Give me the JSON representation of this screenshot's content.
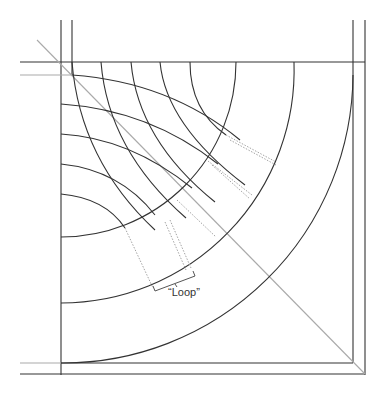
{
  "diagram": {
    "type": "quilting-curve-construction",
    "label_loop": "“Loop”",
    "colors": {
      "line": "#333333",
      "guide": "#aaaaaa",
      "dotted": "#999999",
      "background": "#ffffff"
    },
    "frame": {
      "outer": {
        "left": 61,
        "top": 62,
        "right": 365,
        "bottom": 365
      },
      "inner": {
        "left": 72,
        "top": 75,
        "right": 353,
        "bottom": 353
      }
    },
    "concentric_arcs_center": [
      61,
      62
    ],
    "concentric_arc_radii": [
      175,
      233,
      292
    ],
    "label_position": {
      "x": 168,
      "y": 293
    }
  }
}
